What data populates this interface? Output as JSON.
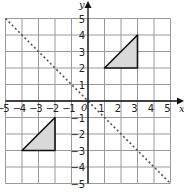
{
  "diagram": {
    "type": "coordinate-grid",
    "x_range": [
      -5,
      5
    ],
    "y_range": [
      -5,
      5
    ],
    "x_axis_label": "x",
    "y_axis_label": "y",
    "origin_label": "0",
    "x_ticks": [
      "-5",
      "-4",
      "-3",
      "-2",
      "-1",
      "1",
      "2",
      "3",
      "4",
      "5"
    ],
    "y_ticks": [
      "5",
      "4",
      "3",
      "2",
      "1",
      "-1",
      "-2",
      "-3",
      "-4",
      "-5"
    ],
    "mirror_line": {
      "equation": "y = -x",
      "style": "dotted",
      "from": [
        -5,
        5
      ],
      "to": [
        5,
        -5
      ]
    },
    "shapes": [
      {
        "name": "triangle-A",
        "vertices": [
          [
            1,
            2
          ],
          [
            3,
            4
          ],
          [
            3,
            2
          ]
        ],
        "fill": "#d9d9d9"
      },
      {
        "name": "triangle-B",
        "vertices": [
          [
            -4,
            -3
          ],
          [
            -2,
            -1
          ],
          [
            -2,
            -3
          ]
        ],
        "fill": "#d9d9d9"
      }
    ],
    "colors": {
      "grid": "#9a9a9a",
      "axis": "#111111",
      "shape_fill": "#d9d9d9",
      "shape_stroke": "#111111",
      "mirror_line": "#555555"
    }
  }
}
